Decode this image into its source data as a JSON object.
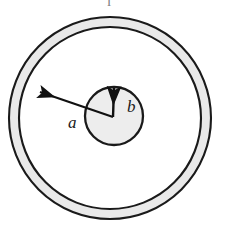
{
  "figure": {
    "type": "concentric-circles-diagram",
    "background_color": "#ffffff",
    "labels": {
      "outer_radius": "a",
      "inner_radius": "b",
      "clipped_top_glyph": "l"
    },
    "colors": {
      "annulus_fill": "#e9e9e9",
      "annulus_stroke": "#1a1a1a",
      "inner_circle_fill": "#ededed",
      "inner_circle_stroke": "#1a1a1a",
      "interior_fill": "#ffffff",
      "arrow_color": "#111111",
      "label_color": "#1a1a1a"
    },
    "geometry": {
      "center_x": 110,
      "center_y": 118,
      "annulus_outer_radius": 101,
      "annulus_inner_radius": 91,
      "inner_circle_center_x": 114,
      "inner_circle_center_y": 116,
      "inner_circle_radius": 29,
      "arrow_origin_x": 113,
      "arrow_origin_y": 117,
      "arrow_a_tip_x": 38,
      "arrow_a_tip_y": 91,
      "arrow_b_tip_x": 114,
      "arrow_b_tip_y": 85
    },
    "label_positions": {
      "a_x": 68,
      "a_y": 126,
      "b_x": 129,
      "b_y": 110,
      "clipped_glyph_x": 109,
      "clipped_glyph_y": 6
    }
  }
}
